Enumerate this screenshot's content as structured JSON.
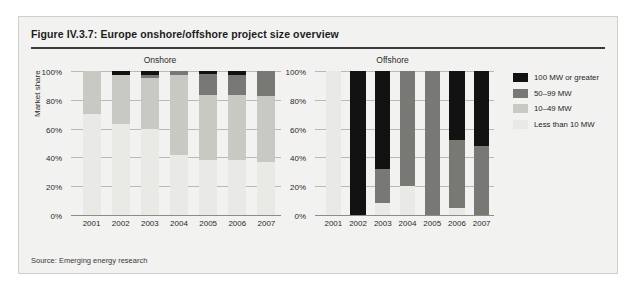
{
  "figure": {
    "title": "Figure IV.3.7: Europe onshore/offshore project size overview",
    "source": "Source: Emerging energy research"
  },
  "legend": {
    "position": "right",
    "items": [
      {
        "label": "100 MW or greater",
        "color": "#121212"
      },
      {
        "label": "50–99 MW",
        "color": "#787874"
      },
      {
        "label": "10–49 MW",
        "color": "#c9c9c4"
      },
      {
        "label": "Less than 10 MW",
        "color": "#e9e9e5"
      }
    ]
  },
  "axis": {
    "ylabel": "Market share",
    "yticks": [
      "0%",
      "20%",
      "40%",
      "60%",
      "80%",
      "100%"
    ]
  },
  "panels": [
    {
      "title": "Onshore"
    },
    {
      "title": "Offshore"
    }
  ],
  "chart_data": [
    {
      "type": "bar",
      "title": "Onshore",
      "subtitle": "",
      "stacked": true,
      "xlabel": "",
      "ylabel": "Market share",
      "ylim": [
        0,
        100
      ],
      "yticks": [
        0,
        20,
        40,
        60,
        80,
        100
      ],
      "grid": true,
      "legend_position": "right",
      "categories": [
        "2001",
        "2002",
        "2003",
        "2004",
        "2005",
        "2006",
        "2007"
      ],
      "series": [
        {
          "name": "Less than 10 MW",
          "color": "#e9e9e5",
          "values": [
            70,
            63,
            60,
            42,
            38,
            38,
            37
          ]
        },
        {
          "name": "10–49 MW",
          "color": "#c9c9c4",
          "values": [
            30,
            34,
            35,
            55,
            45,
            45,
            46
          ]
        },
        {
          "name": "50–99 MW",
          "color": "#787874",
          "values": [
            0,
            0,
            2,
            3,
            15,
            14,
            17
          ]
        },
        {
          "name": "100 MW or greater",
          "color": "#121212",
          "values": [
            0,
            3,
            3,
            0,
            2,
            3,
            0
          ]
        }
      ]
    },
    {
      "type": "bar",
      "title": "Offshore",
      "subtitle": "",
      "stacked": true,
      "xlabel": "",
      "ylabel": "Market share",
      "ylim": [
        0,
        100
      ],
      "yticks": [
        0,
        20,
        40,
        60,
        80,
        100
      ],
      "grid": true,
      "legend_position": "right",
      "categories": [
        "2001",
        "2002",
        "2003",
        "2004",
        "2005",
        "2006",
        "2007"
      ],
      "series": [
        {
          "name": "Less than 10 MW",
          "color": "#e9e9e5",
          "values": [
            100,
            0,
            8,
            20,
            0,
            5,
            0
          ]
        },
        {
          "name": "10–49 MW",
          "color": "#c9c9c4",
          "values": [
            0,
            0,
            0,
            0,
            0,
            0,
            0
          ]
        },
        {
          "name": "50–99 MW",
          "color": "#787874",
          "values": [
            0,
            0,
            24,
            80,
            100,
            47,
            48
          ]
        },
        {
          "name": "100 MW or greater",
          "color": "#121212",
          "values": [
            0,
            100,
            68,
            0,
            0,
            48,
            52
          ]
        }
      ]
    }
  ]
}
